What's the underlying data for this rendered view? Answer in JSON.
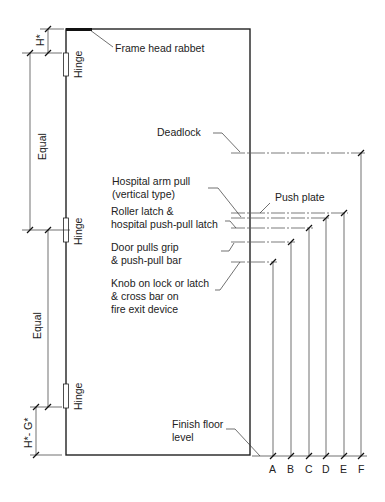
{
  "diagram": {
    "door": {
      "left": 66,
      "right": 250,
      "top": 29,
      "bottom": 455
    },
    "labels": {
      "frame_head_rabbet": "Frame head rabbet",
      "deadlock": "Deadlock",
      "hospital_arm_pull_1": "Hospital arm pull",
      "hospital_arm_pull_2": "(vertical type)",
      "push_plate": "Push plate",
      "roller_latch_1": "Roller latch &",
      "roller_latch_2": "hospital push-pull latch",
      "door_pulls_1": "Door pulls grip",
      "door_pulls_2": "& push-pull bar",
      "knob_1": "Knob on lock or latch",
      "knob_2": "& cross bar on",
      "knob_3": "fire exit device",
      "finish_floor_1": "Finish floor",
      "finish_floor_2": "level"
    },
    "left_dimensions": {
      "h_star": "H*",
      "equal_upper": "Equal",
      "equal_lower": "Equal",
      "h_minus_g": "H*- G*"
    },
    "hinges": [
      "Hinge",
      "Hinge",
      "Hinge"
    ],
    "height_columns": [
      {
        "letter": "A",
        "item": "Knob on lock or latch & cross bar on fire exit device"
      },
      {
        "letter": "B",
        "item": "Door pulls grip & push-pull bar"
      },
      {
        "letter": "C",
        "item": "Roller latch & hospital push-pull latch"
      },
      {
        "letter": "D",
        "item": "Hospital arm pull (vertical type)"
      },
      {
        "letter": "E",
        "item": "Push plate"
      },
      {
        "letter": "F",
        "item": "Deadlock"
      }
    ]
  }
}
